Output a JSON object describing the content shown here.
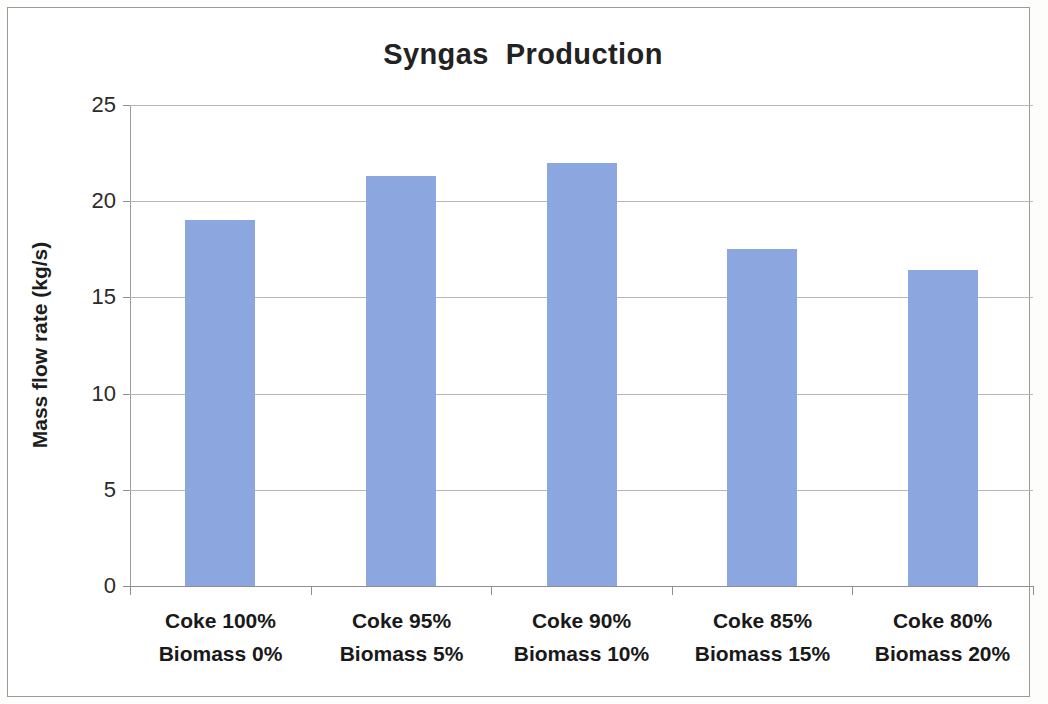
{
  "chart_data": {
    "type": "bar",
    "title": "Syngas  Production",
    "xlabel": "",
    "ylabel": "Mass flow rate (kg/s)",
    "ylim": [
      0,
      25
    ],
    "yticks": [
      0,
      5,
      10,
      15,
      20,
      25
    ],
    "ytick_labels": [
      "0",
      "5",
      "10",
      "15",
      "20",
      "25"
    ],
    "grid": true,
    "legend": false,
    "bar_color": "#8ca6e0",
    "categories": [
      "Coke 100%\nBiomass 0%",
      "Coke 95%\nBiomass 5%",
      "Coke 90%\nBiomass 10%",
      "Coke 85%\nBiomass 15%",
      "Coke 80%\nBiomass 20%"
    ],
    "category_lines": [
      [
        "Coke 100%",
        "Biomass 0%"
      ],
      [
        "Coke 95%",
        "Biomass 5%"
      ],
      [
        "Coke 90%",
        "Biomass 10%"
      ],
      [
        "Coke 85%",
        "Biomass 15%"
      ],
      [
        "Coke 80%",
        "Biomass 20%"
      ]
    ],
    "values": [
      19.0,
      21.3,
      22.0,
      17.5,
      16.4
    ],
    "series": [
      {
        "name": "Syngas mass flow rate",
        "values": [
          19.0,
          21.3,
          22.0,
          17.5,
          16.4
        ]
      }
    ]
  }
}
